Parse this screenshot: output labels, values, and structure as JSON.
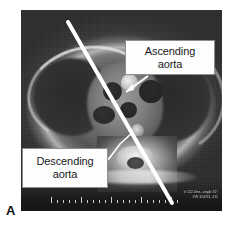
{
  "figure": {
    "panel_letter": "A",
    "modality": "mri-axial-thorax"
  },
  "callouts": [
    {
      "id": "ascending-aorta",
      "line1": "Ascending",
      "line2": "aorta",
      "text": "Ascending aorta",
      "pointer": "arrow"
    },
    {
      "id": "descending-aorta",
      "line1": "Descending",
      "line2": "aorta",
      "text": "Descending aorta",
      "pointer": "line"
    }
  ],
  "overlay": {
    "line1": "tr 122.0ms, angle 32°",
    "line2": "VW 324/93, 411"
  },
  "colors": {
    "callout_fill": "#fdfdfd",
    "callout_border": "#8d8d8d",
    "measurement_line": "#ffffff",
    "leader_line": "#ffffff",
    "panel_letter": "#111111",
    "scan_background": "#2e2e2e"
  },
  "measurement_line": {
    "label": "scan-plane-line",
    "x1": 68,
    "y1": 22,
    "x2": 172,
    "y2": 203,
    "width_px": 4
  },
  "scale_ruler": {
    "label": "scale-ruler",
    "tick_count": 22
  }
}
